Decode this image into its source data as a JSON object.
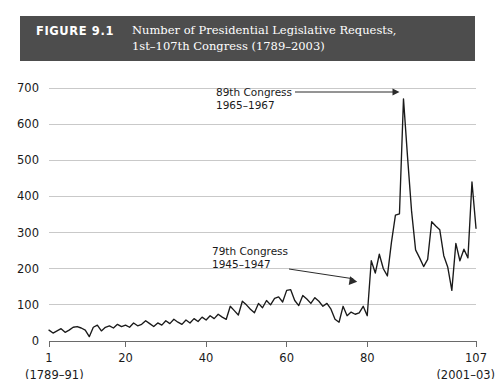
{
  "figure": {
    "label": "FIGURE 9.1",
    "title_line1": "Number of Presidential Legislative Requests,",
    "title_line2": "1st–107th Congress (1789–2003)",
    "header_bg": "#4d4d4d",
    "header_fg": "#ffffff"
  },
  "chart_data": {
    "type": "line",
    "title": "Number of Presidential Legislative Requests, 1st–107th Congress (1789–2003)",
    "xlabel": "",
    "ylabel": "",
    "xlim": [
      1,
      107
    ],
    "ylim": [
      0,
      700
    ],
    "grid": true,
    "legend": "none",
    "line_color": "#1a1a1a",
    "grid_color": "#c9c9c9",
    "y_ticks": [
      0,
      100,
      200,
      300,
      400,
      500,
      600,
      700
    ],
    "x_ticks": [
      1,
      20,
      40,
      60,
      80,
      107
    ],
    "x_tick_labels": [
      "1",
      "20",
      "40",
      "60",
      "80",
      "107"
    ],
    "x_sub_left": "(1789–91)",
    "x_sub_right": "(2001–03)",
    "x_name": "Congress",
    "annotations": [
      {
        "name": "89th Congress",
        "line1": "89th Congress",
        "line2": "1965–1967",
        "points_to_congress": 89,
        "points_to_value": 670,
        "arrow": "horizontal-right"
      },
      {
        "name": "79th Congress",
        "line1": "79th Congress",
        "line2": "1945–1947",
        "points_to_congress": 79,
        "points_to_value": 150,
        "arrow": "diagonal-down-right"
      }
    ],
    "x": [
      1,
      2,
      3,
      4,
      5,
      6,
      7,
      8,
      9,
      10,
      11,
      12,
      13,
      14,
      15,
      16,
      17,
      18,
      19,
      20,
      21,
      22,
      23,
      24,
      25,
      26,
      27,
      28,
      29,
      30,
      31,
      32,
      33,
      34,
      35,
      36,
      37,
      38,
      39,
      40,
      41,
      42,
      43,
      44,
      45,
      46,
      47,
      48,
      49,
      50,
      51,
      52,
      53,
      54,
      55,
      56,
      57,
      58,
      59,
      60,
      61,
      62,
      63,
      64,
      65,
      66,
      67,
      68,
      69,
      70,
      71,
      72,
      73,
      74,
      75,
      76,
      77,
      78,
      79,
      80,
      81,
      82,
      83,
      84,
      85,
      86,
      87,
      88,
      89,
      90,
      91,
      92,
      93,
      94,
      95,
      96,
      97,
      98,
      99,
      100,
      101,
      102,
      103,
      104,
      105,
      106,
      107
    ],
    "values": [
      30,
      22,
      28,
      34,
      24,
      30,
      38,
      40,
      36,
      30,
      12,
      38,
      44,
      28,
      38,
      42,
      36,
      46,
      40,
      44,
      38,
      50,
      42,
      46,
      56,
      48,
      40,
      50,
      44,
      56,
      48,
      60,
      52,
      46,
      58,
      50,
      62,
      54,
      66,
      58,
      70,
      62,
      74,
      66,
      60,
      96,
      84,
      72,
      110,
      100,
      88,
      78,
      104,
      92,
      112,
      100,
      118,
      122,
      108,
      140,
      142,
      112,
      98,
      126,
      116,
      104,
      120,
      110,
      96,
      104,
      88,
      60,
      52,
      96,
      70,
      80,
      74,
      78,
      96,
      70,
      222,
      188,
      240,
      200,
      180,
      272,
      348,
      352,
      670,
      510,
      360,
      252,
      230,
      206,
      226,
      330,
      318,
      308,
      236,
      204,
      140,
      270,
      222,
      254,
      230,
      440,
      312
    ]
  }
}
